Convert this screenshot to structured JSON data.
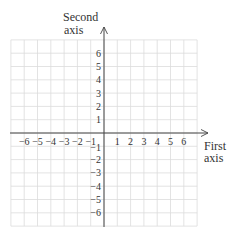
{
  "diagram": {
    "type": "coordinate-plane",
    "x_axis_label_line1": "First",
    "x_axis_label_line2": "axis",
    "y_axis_label_line1": "Second",
    "y_axis_label_line2": "axis",
    "x_range": [
      -7,
      7
    ],
    "y_range": [
      -7,
      7
    ],
    "x_ticks": [
      -6,
      -5,
      -4,
      -3,
      -2,
      -1,
      1,
      2,
      3,
      4,
      5,
      6
    ],
    "y_ticks": [
      6,
      5,
      4,
      3,
      2,
      1,
      -1,
      -2,
      -3,
      -4,
      -5,
      -6
    ],
    "x_tick_labels": [
      "−6",
      "−5",
      "−4",
      "−3",
      "−2",
      "−1",
      "1",
      "2",
      "3",
      "4",
      "5",
      "6"
    ],
    "y_tick_labels": [
      "6",
      "5",
      "4",
      "3",
      "2",
      "1",
      "−1",
      "−2",
      "−3",
      "−4",
      "−5",
      "−6"
    ],
    "colors": {
      "grid": "#dcdcdc",
      "axis": "#444444",
      "text": "#333333"
    }
  }
}
